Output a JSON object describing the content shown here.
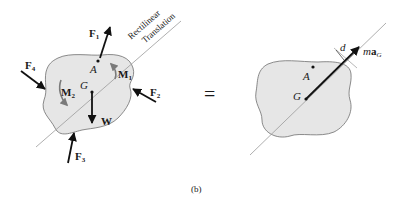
{
  "figure": {
    "caption": "(b)",
    "equals_sign": "=",
    "left_diagram": {
      "title": "free-body diagram",
      "line_label_1": "Rectilinear",
      "line_label_2": "Translation",
      "points": {
        "A": "A",
        "G": "G"
      },
      "forces": [
        {
          "id": "F1",
          "base": "F",
          "sub": "1"
        },
        {
          "id": "F2",
          "base": "F",
          "sub": "2"
        },
        {
          "id": "F3",
          "base": "F",
          "sub": "3"
        },
        {
          "id": "F4",
          "base": "F",
          "sub": "4"
        },
        {
          "id": "W",
          "base": "W",
          "sub": ""
        }
      ],
      "moments": [
        {
          "id": "M1",
          "base": "M",
          "sub": "1"
        },
        {
          "id": "M2",
          "base": "M",
          "sub": "2"
        }
      ]
    },
    "right_diagram": {
      "title": "kinetic diagram",
      "points": {
        "A": "A",
        "G": "G"
      },
      "inertia_vector": {
        "prefix": "m",
        "base": "a",
        "sub": "G"
      },
      "distance_label": "d"
    },
    "colors": {
      "body_fill": "#e6e6e6",
      "body_stroke": "#6e6e6e",
      "line": "#9a9a9a",
      "arrow": "#111111",
      "moment_arrow": "#7a7a7a"
    }
  }
}
